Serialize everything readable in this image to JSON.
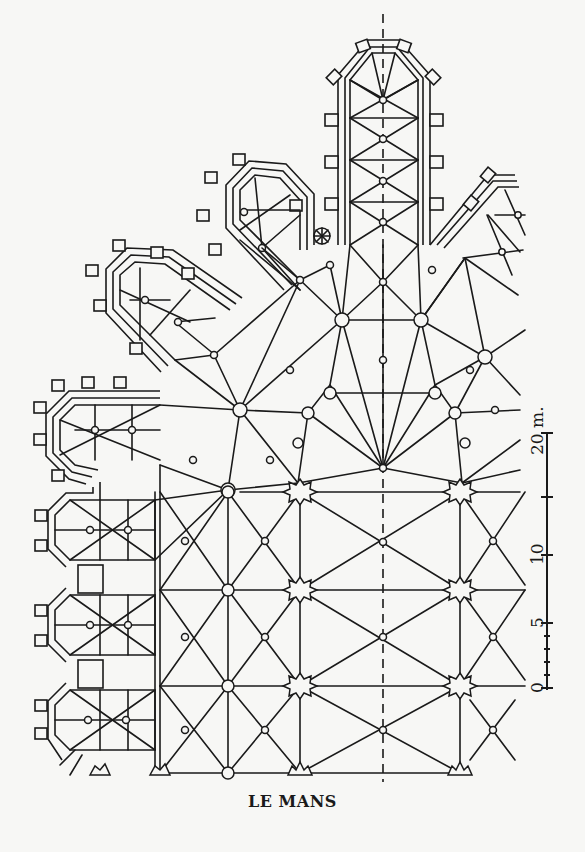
{
  "caption": "LE MANS",
  "scale_bar": {
    "unit_label": "20 m.",
    "ticks": [
      {
        "label": "0",
        "y": 684
      },
      {
        "label": "5",
        "y": 623
      },
      {
        "label": "10",
        "y": 555
      },
      {
        "label": "",
        "y": 497
      },
      {
        "label": "20",
        "y": 433
      }
    ],
    "x": 547
  },
  "axis": {
    "x": 383,
    "y1": 14,
    "y2": 782
  },
  "colors": {
    "ink": "#1a1a1a",
    "paper": "#f7f7f5"
  }
}
